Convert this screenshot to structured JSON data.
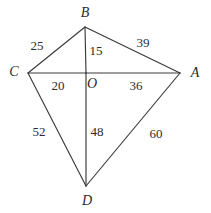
{
  "figure": {
    "type": "geometry-diagram",
    "shape": "kite",
    "background_color": "#ffffff",
    "line_color": "#3a3a3a",
    "text_color": "#2b2b2b",
    "width": 211,
    "height": 213,
    "vertices": [
      {
        "id": "B",
        "label": "B",
        "x": 85,
        "y": 27,
        "label_x": 85,
        "label_y": 13
      },
      {
        "id": "C",
        "label": "C",
        "x": 28,
        "y": 73,
        "label_x": 14,
        "label_y": 72
      },
      {
        "id": "A",
        "label": "A",
        "x": 180,
        "y": 73,
        "label_x": 195,
        "label_y": 73
      },
      {
        "id": "D",
        "label": "D",
        "x": 86,
        "y": 186,
        "label_x": 87,
        "label_y": 201
      },
      {
        "id": "O",
        "label": "O",
        "x": 86,
        "y": 73,
        "label_x": 92,
        "label_y": 84
      }
    ],
    "segments": [
      {
        "id": "BC",
        "from": "B",
        "to": "C",
        "length": "25",
        "label_x": 37,
        "label_y": 45
      },
      {
        "id": "BA",
        "from": "B",
        "to": "A",
        "length": "39",
        "label_x": 143,
        "label_y": 42
      },
      {
        "id": "BO",
        "from": "B",
        "to": "O",
        "length": "15",
        "label_x": 96,
        "label_y": 50
      },
      {
        "id": "CO",
        "from": "C",
        "to": "O",
        "length": "20",
        "label_x": 58,
        "label_y": 85
      },
      {
        "id": "OA",
        "from": "O",
        "to": "A",
        "length": "36",
        "label_x": 136,
        "label_y": 85
      },
      {
        "id": "CD",
        "from": "C",
        "to": "D",
        "length": "52",
        "label_x": 39,
        "label_y": 131
      },
      {
        "id": "OD",
        "from": "O",
        "to": "D",
        "length": "48",
        "label_x": 97,
        "label_y": 131
      },
      {
        "id": "DA",
        "from": "D",
        "to": "A",
        "length": "60",
        "label_x": 156,
        "label_y": 133
      }
    ]
  }
}
